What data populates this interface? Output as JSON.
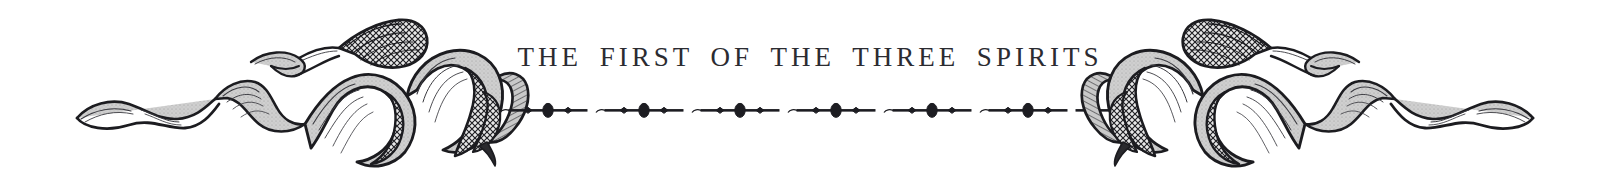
{
  "page": {
    "kind": "book-chapter-header",
    "background_color": "#ffffff",
    "ink_color": "#2b2b31"
  },
  "header": {
    "title": "THE FIRST OF THE THREE SPIRITS"
  },
  "ornaments": {
    "left": {
      "name": "engraved-ribbon-ornament-left",
      "description": "twisting hand-engraved ribbon scroll with crosshatch shading"
    },
    "right": {
      "name": "engraved-ribbon-ornament-right",
      "description": "mirrored twisting hand-engraved ribbon scroll with crosshatch shading"
    }
  },
  "rule": {
    "name": "decorative-dotted-rule",
    "description": "horizontal rule with alternating small diamonds and large ovals",
    "repeats": 6,
    "color": "#1d1d22"
  }
}
